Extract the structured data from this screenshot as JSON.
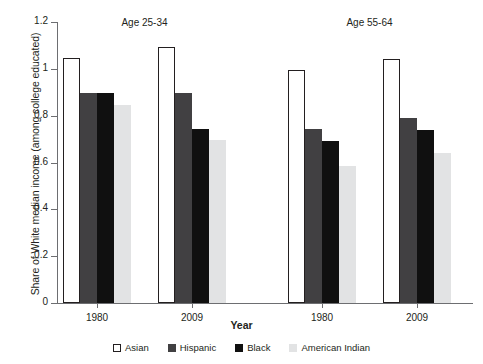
{
  "chart_data": {
    "type": "bar",
    "title": "",
    "xlabel": "Year",
    "ylabel": "Share of White median income (among college educated)",
    "ylim": [
      0,
      1.2
    ],
    "yticks": [
      "0",
      "0.2",
      "0.4",
      "0.6",
      "0.8",
      "1",
      "1.2"
    ],
    "ytick_values": [
      0,
      0.2,
      0.4,
      0.6,
      0.8,
      1.0,
      1.2
    ],
    "grid": false,
    "legend_position": "bottom",
    "panels": [
      {
        "title": "Age 25-34",
        "categories": [
          "1980",
          "2009"
        ]
      },
      {
        "title": "Age 55-64",
        "categories": [
          "1980",
          "2009"
        ]
      }
    ],
    "categories": [
      "1980",
      "2009",
      "1980",
      "2009"
    ],
    "series": [
      {
        "name": "Asian",
        "color": "#ffffff",
        "values": [
          1.045,
          1.095,
          0.995,
          1.04
        ]
      },
      {
        "name": "Hispanic",
        "color": "#414042",
        "values": [
          0.895,
          0.895,
          0.745,
          0.79
        ]
      },
      {
        "name": "Black",
        "color": "#101010",
        "values": [
          0.895,
          0.745,
          0.69,
          0.74
        ]
      },
      {
        "name": "American Indian",
        "color": "#e2e3e4",
        "values": [
          0.845,
          0.695,
          0.585,
          0.64
        ]
      }
    ]
  },
  "legend": {
    "items": [
      {
        "label": "Asian",
        "key": "asian"
      },
      {
        "label": "Hispanic",
        "key": "hispanic"
      },
      {
        "label": "Black",
        "key": "black"
      },
      {
        "label": "American Indian",
        "key": "amerind"
      }
    ]
  }
}
